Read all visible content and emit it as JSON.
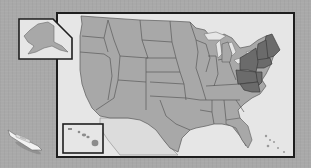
{
  "map": {
    "title": "United States map with Northeast region highlighted",
    "colors": {
      "background": "#a9a9a9",
      "water": "#e6e6e6",
      "state_fill": "#a8a8a8",
      "state_border": "#5a5a5a",
      "highlight_fill": "#6b6b6b",
      "frame": "#1e1e1e",
      "mexico_fill": "#e2e2e2"
    },
    "highlighted_region": "Northeast",
    "highlighted_states": [
      "ME",
      "NH",
      "VT",
      "MA",
      "RI",
      "CT",
      "NY",
      "NJ",
      "PA",
      "DE",
      "MD"
    ],
    "insets": [
      {
        "name": "Alaska"
      },
      {
        "name": "Hawaii"
      }
    ],
    "decoration": {
      "icon": "ship-icon"
    }
  }
}
